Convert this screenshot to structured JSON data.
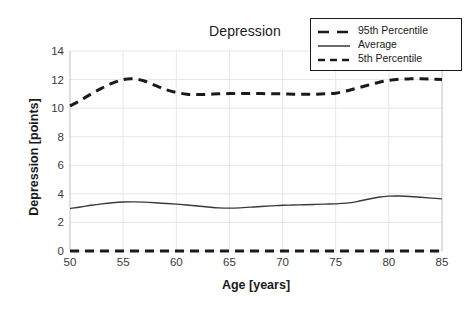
{
  "chart_data": {
    "type": "line",
    "title": "Depression",
    "xlabel": "Age [years]",
    "ylabel": "Depression [points]",
    "xlim": [
      50,
      85
    ],
    "ylim": [
      0,
      14
    ],
    "xticks": [
      50,
      55,
      60,
      65,
      70,
      75,
      80,
      85
    ],
    "yticks": [
      0,
      2,
      4,
      6,
      8,
      10,
      12,
      14
    ],
    "grid": true,
    "legend_position": "top-right",
    "x": [
      50,
      51,
      52,
      53,
      54,
      55,
      56,
      57,
      58,
      59,
      60,
      61,
      62,
      63,
      64,
      65,
      66,
      67,
      68,
      69,
      70,
      71,
      72,
      73,
      74,
      75,
      76,
      77,
      78,
      79,
      80,
      81,
      82,
      83,
      84,
      85
    ],
    "series": [
      {
        "name": "95th Percentile",
        "style": "dashed",
        "color": "#1a1a1a",
        "width": 3.0,
        "values": [
          10.15,
          10.55,
          11.0,
          11.4,
          11.75,
          12.0,
          12.05,
          11.9,
          11.6,
          11.3,
          11.1,
          10.98,
          10.95,
          10.97,
          11.0,
          11.02,
          11.03,
          11.03,
          11.02,
          11.0,
          11.0,
          10.98,
          10.97,
          10.97,
          11.0,
          11.05,
          11.2,
          11.4,
          11.6,
          11.8,
          11.95,
          12.03,
          12.05,
          12.05,
          12.03,
          12.0
        ]
      },
      {
        "name": "Average",
        "style": "solid",
        "color": "#3a3a3a",
        "width": 1.4,
        "values": [
          2.98,
          3.08,
          3.2,
          3.3,
          3.38,
          3.43,
          3.44,
          3.42,
          3.38,
          3.33,
          3.28,
          3.22,
          3.15,
          3.08,
          3.02,
          3.0,
          3.02,
          3.07,
          3.12,
          3.16,
          3.2,
          3.22,
          3.24,
          3.26,
          3.28,
          3.3,
          3.35,
          3.46,
          3.62,
          3.76,
          3.84,
          3.85,
          3.82,
          3.76,
          3.7,
          3.65
        ]
      },
      {
        "name": "5th Percentile",
        "style": "dashed",
        "color": "#1a1a1a",
        "width": 3.0,
        "values": [
          0,
          0,
          0,
          0,
          0,
          0,
          0,
          0,
          0,
          0,
          0,
          0,
          0,
          0,
          0,
          0,
          0,
          0,
          0,
          0,
          0,
          0,
          0,
          0,
          0,
          0,
          0,
          0,
          0,
          0,
          0,
          0,
          0,
          0,
          0,
          0
        ]
      }
    ]
  },
  "colors": {
    "line": "#1a1a1a",
    "average": "#3a3a3a",
    "grid": "#e6e6e6",
    "axis": "#cccccc",
    "background": "#ffffff",
    "text": "#1a1a1a"
  },
  "legend": {
    "entries": [
      {
        "label": "95th Percentile",
        "style": "dashed"
      },
      {
        "label": "Average",
        "style": "solid"
      },
      {
        "label": "5th Percentile",
        "style": "dashed"
      }
    ]
  }
}
